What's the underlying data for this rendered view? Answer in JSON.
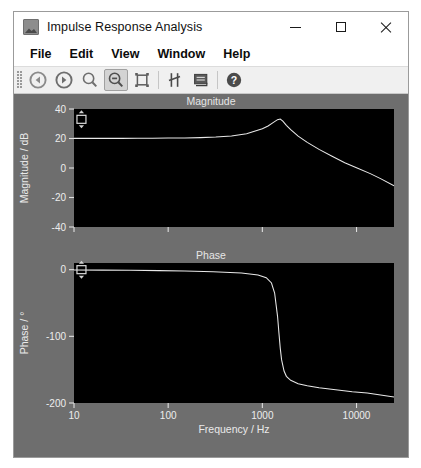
{
  "window": {
    "title": "Impulse Response Analysis",
    "icon": "picture-icon",
    "controls": {
      "minimize": "minimize-icon",
      "maximize": "maximize-icon",
      "close": "close-icon"
    }
  },
  "menubar": {
    "items": [
      {
        "label": "File"
      },
      {
        "label": "Edit"
      },
      {
        "label": "View"
      },
      {
        "label": "Window"
      },
      {
        "label": "Help"
      }
    ]
  },
  "toolbar": {
    "buttons": [
      {
        "name": "back-icon",
        "tooltip": "Back",
        "active": false
      },
      {
        "name": "forward-icon",
        "tooltip": "Forward",
        "active": false
      },
      {
        "name": "zoom-in-icon",
        "tooltip": "Zoom In",
        "active": false
      },
      {
        "name": "zoom-out-icon",
        "tooltip": "Zoom Out",
        "active": true
      },
      {
        "name": "zoom-fit-icon",
        "tooltip": "Zoom To Fit",
        "active": false
      },
      {
        "name": "cursor-icon",
        "tooltip": "Cursor",
        "active": false
      },
      {
        "name": "legend-icon",
        "tooltip": "Legend",
        "active": false
      },
      {
        "name": "help-icon",
        "tooltip": "Help",
        "active": false
      }
    ]
  },
  "chart_data": [
    {
      "type": "line",
      "title": "Magnitude",
      "xlabel": "",
      "ylabel": "Magnitude / dB",
      "xscale": "log",
      "xlim": [
        10,
        25000
      ],
      "ylim": [
        -40,
        40
      ],
      "xticks": [
        10,
        100,
        1000,
        10000
      ],
      "xticklabels": [
        "10",
        "100",
        "1000",
        "10000"
      ],
      "yticks": [
        -40,
        -20,
        0,
        20,
        40
      ],
      "yticklabels": [
        "-40",
        "-20",
        "0",
        "20",
        "40"
      ],
      "grid": false,
      "background": "#000000",
      "line_color": "#e8e8e8",
      "cursor": {
        "x": 12,
        "y": 33,
        "label": "cursor-handle"
      },
      "x": [
        10,
        15,
        22,
        32,
        47,
        68,
        100,
        150,
        220,
        320,
        470,
        680,
        1000,
        1150,
        1300,
        1450,
        1550,
        1650,
        1800,
        2000,
        2400,
        3000,
        4000,
        5500,
        7500,
        10000,
        14000,
        18000,
        25000
      ],
      "values": [
        20.1,
        20.1,
        20.1,
        20.1,
        20.2,
        20.2,
        20.3,
        20.4,
        20.6,
        21.0,
        21.7,
        23.2,
        26.6,
        28.5,
        30.8,
        32.8,
        33.2,
        31.8,
        28.9,
        26.0,
        21.6,
        17.4,
        12.6,
        8.0,
        3.6,
        0.1,
        -3.8,
        -7.2,
        -12.0
      ],
      "peak": {
        "frequency": 1550,
        "magnitude": 33.2
      }
    },
    {
      "type": "line",
      "title": "Phase",
      "xlabel": "Frequency / Hz",
      "ylabel": "Phase / °",
      "xscale": "log",
      "xlim": [
        10,
        25000
      ],
      "ylim": [
        -200,
        10
      ],
      "xticks": [
        10,
        100,
        1000,
        10000
      ],
      "xticklabels": [
        "10",
        "100",
        "1000",
        "10000"
      ],
      "yticks": [
        0,
        -100,
        -200
      ],
      "yticklabels": [
        "0",
        "-100",
        "-200"
      ],
      "grid": false,
      "background": "#000000",
      "line_color": "#e8e8e8",
      "cursor": {
        "x": 12,
        "y": 0,
        "label": "cursor-handle"
      },
      "x": [
        10,
        20,
        40,
        80,
        150,
        300,
        600,
        900,
        1100,
        1250,
        1350,
        1450,
        1500,
        1550,
        1600,
        1700,
        1800,
        2000,
        2400,
        3000,
        4000,
        6000,
        9000,
        13000,
        18000,
        25000
      ],
      "values": [
        -0.5,
        -0.7,
        -1.0,
        -1.4,
        -2.0,
        -3.0,
        -5.0,
        -8.0,
        -12.0,
        -20.0,
        -35.0,
        -70.0,
        -95.0,
        -118.0,
        -135.0,
        -152.0,
        -160.0,
        -166.0,
        -171.0,
        -174.0,
        -177.0,
        -180.0,
        -183.0,
        -185.0,
        -188.0,
        -191.0
      ]
    }
  ]
}
